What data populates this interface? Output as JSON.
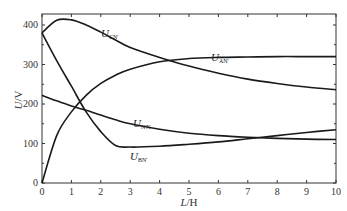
{
  "chart_data": {
    "type": "line",
    "title": "",
    "xlabel": "L/H",
    "ylabel": "U/V",
    "xlim": [
      0,
      10
    ],
    "ylim": [
      0,
      420
    ],
    "xticks": [
      0,
      1,
      2,
      3,
      4,
      5,
      6,
      7,
      8,
      9,
      10
    ],
    "yticks": [
      0,
      100,
      200,
      300,
      400
    ],
    "grid": false,
    "legend": "inline labels",
    "x": [
      0,
      0.5,
      1,
      1.5,
      2,
      2.5,
      3,
      4,
      5,
      6,
      7,
      8,
      9,
      10
    ],
    "series": [
      {
        "name": "U_CN'",
        "label_main": "U",
        "label_sub": "CN'",
        "values": [
          380,
          412,
          413,
          400,
          382,
          362,
          343,
          318,
          296,
          278,
          263,
          252,
          243,
          236
        ]
      },
      {
        "name": "U_AN'",
        "label_main": "U",
        "label_sub": "AN'",
        "values": [
          0,
          120,
          180,
          222,
          252,
          273,
          288,
          307,
          315,
          318,
          319,
          320,
          320,
          320
        ]
      },
      {
        "name": "U_BN'",
        "label_main": "U",
        "label_sub": "BN'",
        "values": [
          380,
          310,
          245,
          180,
          130,
          95,
          91,
          93,
          98,
          104,
          112,
          120,
          128,
          135
        ]
      },
      {
        "name": "U_N'N",
        "label_main": "U",
        "label_sub": "N'N",
        "values": [
          222,
          208,
          195,
          184,
          172,
          160,
          150,
          136,
          126,
          120,
          116,
          113,
          111,
          110
        ]
      }
    ]
  },
  "axes": {
    "x_title_main": "L",
    "x_title_unit": "/H",
    "y_title_main": "U",
    "y_title_unit": "/V",
    "x_tick_labels": [
      "0",
      "1",
      "2",
      "3",
      "4",
      "5",
      "6",
      "7",
      "8",
      "9",
      "10"
    ],
    "y_tick_labels": [
      "0",
      "100",
      "200",
      "300",
      "400"
    ]
  },
  "labels": {
    "cn": {
      "main": "U",
      "sub": "CN'"
    },
    "an": {
      "main": "U",
      "sub": "AN'"
    },
    "nn": {
      "main": "U",
      "sub": "N'N"
    },
    "bn": {
      "main": "U",
      "sub": "BN'"
    }
  },
  "colors": {
    "line": "#1a1a1a",
    "axis": "#333333",
    "background": "#ffffff"
  }
}
